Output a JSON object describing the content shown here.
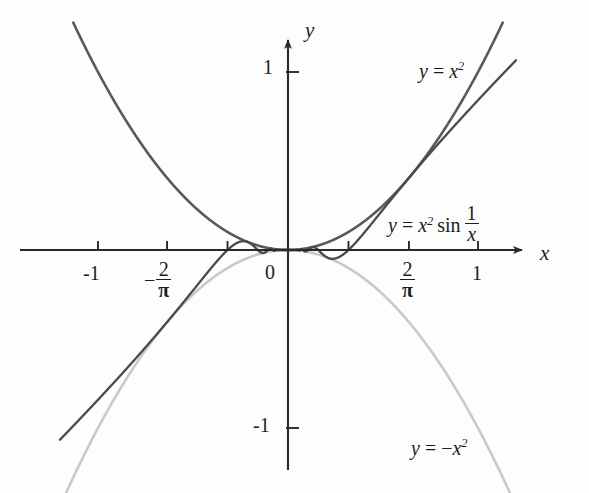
{
  "figure": {
    "kind": "math-graph"
  },
  "axes": {
    "x_axis_label": "x",
    "y_axis_label": "y",
    "origin_label": "0",
    "x_ticks": [
      {
        "label_text": "-1",
        "value": -1
      },
      {
        "label_num": "2",
        "label_den": "π",
        "negative": true,
        "value": -0.6366
      },
      {
        "label_text": "",
        "value": -0.3183
      },
      {
        "label_text": "",
        "value": 0.3183
      },
      {
        "label_num": "2",
        "label_den": "π",
        "negative": false,
        "value": 0.6366
      },
      {
        "label_text": "1",
        "value": 1
      }
    ],
    "y_ticks": [
      {
        "label_text": "1",
        "value": 1
      },
      {
        "label_text": "-1",
        "value": -1
      }
    ],
    "xlim": [
      -1.42,
      1.33
    ],
    "ylim": [
      -1.36,
      1.28
    ]
  },
  "annotations": [
    {
      "name": "label-x-squared",
      "parts": {
        "lhs": "y",
        "eq": " = ",
        "base": "x",
        "exp": "2"
      },
      "plain": "y = x²"
    },
    {
      "name": "label-x-squared-sin",
      "parts": {
        "lhs": "y",
        "eq": " = ",
        "base": "x",
        "exp": "2",
        "fn": "sin",
        "num": "1",
        "den": "x"
      },
      "plain": "y = x² sin 1/x"
    },
    {
      "name": "label-neg-x-squared",
      "parts": {
        "lhs": "y",
        "eq": " = ",
        "minus": "−",
        "base": "x",
        "exp": "2"
      },
      "plain": "y = −x²"
    }
  ],
  "colors": {
    "axis": "#2a2a2a",
    "curve_x_squared": "#595959",
    "curve_neg_x_squared": "#c9c9c9",
    "curve_sin": "#4a4a4a",
    "text": "#1c1c1c",
    "background": "#fdfdfd"
  },
  "chart_data": {
    "type": "line",
    "title": "",
    "xlabel": "x",
    "ylabel": "y",
    "xlim": [
      -1.42,
      1.33
    ],
    "ylim": [
      -1.36,
      1.28
    ],
    "grid": false,
    "legend": "inline-annotations",
    "xtick_labels": [
      "-1",
      "-2/π",
      "",
      "",
      "2/π",
      "1"
    ],
    "xtick_values": [
      -1,
      -0.6366,
      -0.3183,
      0.3183,
      0.6366,
      1
    ],
    "ytick_labels": [
      "1",
      "-1"
    ],
    "ytick_values": [
      1,
      -1
    ],
    "series": [
      {
        "name": "y = x^2",
        "formula": "x^2",
        "color": "#595959",
        "domain": [
          -1.13,
          1.13
        ],
        "sample_points": [
          {
            "x": -1.13,
            "y": 1.277
          },
          {
            "x": -1.0,
            "y": 1.0
          },
          {
            "x": -0.8,
            "y": 0.64
          },
          {
            "x": -0.6366,
            "y": 0.405
          },
          {
            "x": -0.4,
            "y": 0.16
          },
          {
            "x": -0.2,
            "y": 0.04
          },
          {
            "x": 0.0,
            "y": 0.0
          },
          {
            "x": 0.2,
            "y": 0.04
          },
          {
            "x": 0.4,
            "y": 0.16
          },
          {
            "x": 0.6366,
            "y": 0.405
          },
          {
            "x": 0.8,
            "y": 0.64
          },
          {
            "x": 1.0,
            "y": 1.0
          },
          {
            "x": 1.13,
            "y": 1.277
          }
        ]
      },
      {
        "name": "y = -x^2",
        "formula": "-x^2",
        "color": "#c9c9c9",
        "domain": [
          -1.17,
          1.17
        ],
        "sample_points": [
          {
            "x": -1.17,
            "y": -1.369
          },
          {
            "x": -1.0,
            "y": -1.0
          },
          {
            "x": -0.8,
            "y": -0.64
          },
          {
            "x": -0.6366,
            "y": -0.405
          },
          {
            "x": -0.4,
            "y": -0.16
          },
          {
            "x": -0.2,
            "y": -0.04
          },
          {
            "x": 0.0,
            "y": 0.0
          },
          {
            "x": 0.2,
            "y": -0.04
          },
          {
            "x": 0.4,
            "y": -0.16
          },
          {
            "x": 0.6366,
            "y": -0.405
          },
          {
            "x": 0.8,
            "y": -0.64
          },
          {
            "x": 1.0,
            "y": -1.0
          },
          {
            "x": 1.17,
            "y": -1.369
          }
        ]
      },
      {
        "name": "y = x^2 sin(1/x)",
        "formula": "x^2*sin(1/x)",
        "color": "#4a4a4a",
        "domain": [
          -1.2,
          1.2
        ],
        "sample_points": [
          {
            "x": -1.2,
            "y": -1.105
          },
          {
            "x": -1.0,
            "y": -0.841
          },
          {
            "x": -0.8,
            "y": -0.598
          },
          {
            "x": -0.6366,
            "y": -0.405
          },
          {
            "x": -0.5,
            "y": -0.227
          },
          {
            "x": -0.4,
            "y": -0.095
          },
          {
            "x": -0.3183,
            "y": 0.0
          },
          {
            "x": -0.25,
            "y": 0.048
          },
          {
            "x": -0.2,
            "y": 0.036
          },
          {
            "x": -0.15,
            "y": -0.008
          },
          {
            "x": -0.1,
            "y": 0.005
          },
          {
            "x": -0.05,
            "y": 0.0
          },
          {
            "x": 0.0,
            "y": 0.0
          },
          {
            "x": 0.05,
            "y": -0.0
          },
          {
            "x": 0.1,
            "y": -0.005
          },
          {
            "x": 0.15,
            "y": 0.008
          },
          {
            "x": 0.2,
            "y": -0.036
          },
          {
            "x": 0.25,
            "y": -0.048
          },
          {
            "x": 0.3183,
            "y": 0.0
          },
          {
            "x": 0.4,
            "y": 0.095
          },
          {
            "x": 0.5,
            "y": 0.227
          },
          {
            "x": 0.6366,
            "y": 0.405
          },
          {
            "x": 0.8,
            "y": 0.598
          },
          {
            "x": 1.0,
            "y": 0.841
          },
          {
            "x": 1.2,
            "y": 1.105
          }
        ]
      }
    ]
  },
  "layout": {
    "origin_px": {
      "x": 288,
      "y": 250
    },
    "scale_px_per_unit": {
      "x": 190,
      "y": 178
    }
  }
}
